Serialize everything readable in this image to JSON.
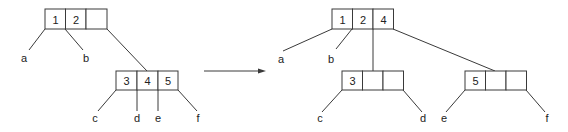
{
  "diagram": {
    "before": {
      "root": {
        "keys": [
          "1",
          "2",
          ""
        ]
      },
      "child": {
        "keys": [
          "3",
          "4",
          "5"
        ]
      },
      "leaves": [
        "a",
        "b",
        "c",
        "d",
        "e",
        "f"
      ]
    },
    "after": {
      "root": {
        "keys": [
          "1",
          "2",
          "4"
        ]
      },
      "left_child": {
        "keys": [
          "3",
          "",
          ""
        ]
      },
      "right_child": {
        "keys": [
          "5",
          "",
          ""
        ]
      },
      "leaves": [
        "a",
        "b",
        "c",
        "d",
        "e",
        "f"
      ]
    },
    "arrow": "transforms-to"
  }
}
